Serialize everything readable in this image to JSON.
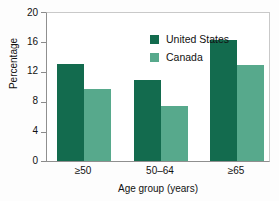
{
  "chart_data": {
    "type": "bar",
    "title": "",
    "xlabel": "Age group (years)",
    "ylabel": "Percentage",
    "categories": [
      "≥50",
      "50–64",
      "≥65"
    ],
    "series": [
      {
        "name": "United States",
        "values": [
          13.0,
          10.8,
          16.1
        ],
        "color": "#136b4e"
      },
      {
        "name": "Canada",
        "values": [
          9.6,
          7.4,
          12.8
        ],
        "color": "#57a98c"
      }
    ],
    "ylim": [
      0,
      20
    ],
    "yticks": [
      0,
      4,
      8,
      12,
      16,
      20
    ],
    "ytick_labels": [
      "0",
      "4",
      "8",
      "12",
      "16",
      "20"
    ],
    "grid": false,
    "legend_position": "top-center"
  },
  "axes": {
    "y_title": "Percentage",
    "x_title": "Age group (years)",
    "y_labels": [
      "20",
      "16",
      "12",
      "8",
      "4",
      "0"
    ],
    "x_labels": [
      "≥50",
      "50–64",
      "≥65"
    ]
  },
  "legend": {
    "items": [
      {
        "label": "United States",
        "color": "#136b4e"
      },
      {
        "label": "Canada",
        "color": "#57a98c"
      }
    ]
  },
  "colors": {
    "united_states": "#136b4e",
    "canada": "#57a98c",
    "axis": "#8f8f8f",
    "frame": "#c9c9c9",
    "background": "#fdfdfd",
    "plot_background": "#ffffff"
  }
}
